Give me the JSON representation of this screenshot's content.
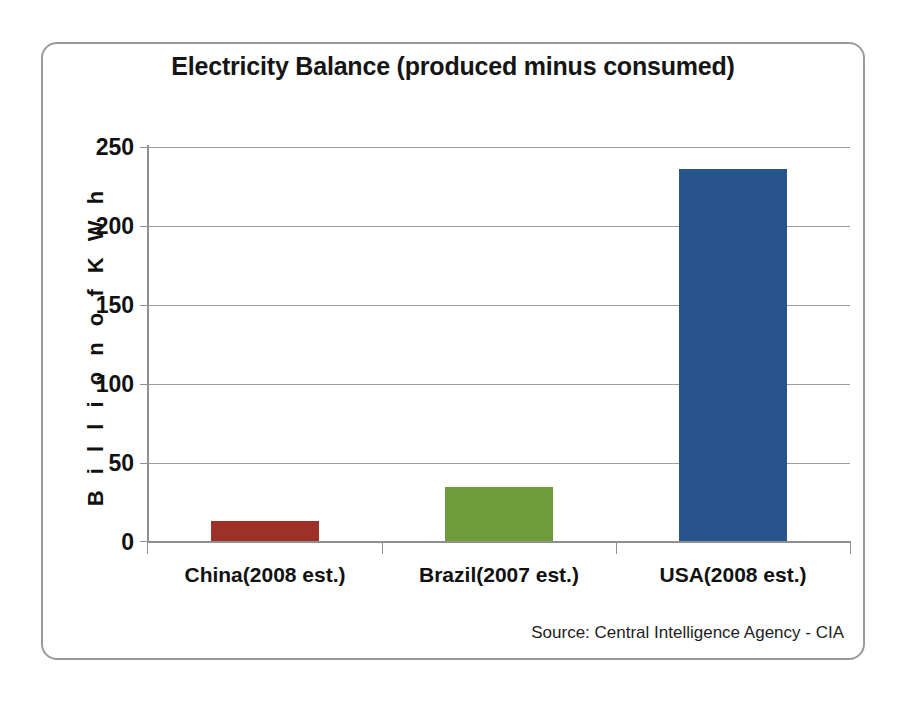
{
  "chart_data": {
    "type": "bar",
    "title": "Electricity Balance (produced minus consumed)",
    "xlabel": "",
    "ylabel": "B i l l i o n   o f   K W h",
    "categories": [
      "China(2008 est.)",
      "Brazil(2007 est.)",
      "USA(2008 est.)"
    ],
    "values": [
      12.5,
      34,
      236
    ],
    "series": [
      {
        "name": "Electricity Balance",
        "values": [
          12.5,
          34,
          236
        ],
        "colors": [
          "#9e3127",
          "#6f9c3b",
          "#27548a"
        ]
      }
    ],
    "ylim": [
      0,
      250
    ],
    "y_ticks": [
      0,
      50,
      100,
      150,
      200,
      250
    ],
    "y_tick_labels": [
      "0",
      "50",
      "100",
      "150",
      "200",
      "250"
    ],
    "grid": true,
    "legend": false,
    "source_note": "Source: Central Intelligence Agency - CIA",
    "colors": {
      "china_bar": "#9e3127",
      "brazil_bar": "#6f9c3b",
      "usa_bar": "#27548a",
      "gridline": "#9c9c9c",
      "axis": "#8f8f8f",
      "frame": "#9a9a9a",
      "text": "#111111"
    }
  }
}
